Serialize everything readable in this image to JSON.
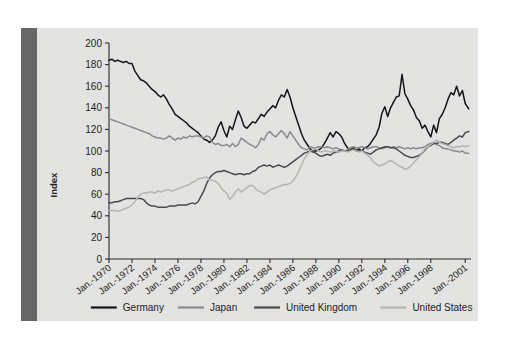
{
  "figure": {
    "background_color": "#e3e3e1",
    "spine_color": "#676767",
    "page_background": "#ffffff"
  },
  "chart_data": {
    "type": "line",
    "title": "",
    "subtitle": "",
    "xlabel": "",
    "ylabel": "Index",
    "ylim": [
      0,
      200
    ],
    "ytick_step": 20,
    "yticks": [
      0,
      20,
      40,
      60,
      80,
      100,
      120,
      140,
      160,
      180,
      200
    ],
    "ytick_labels": [
      "0",
      "20",
      "40",
      "60",
      "80",
      "100",
      "120",
      "140",
      "160",
      "180",
      "200"
    ],
    "xtick_labels": [
      "Jan.-1970",
      "Jan.-1972",
      "Jan.-1974",
      "Jan.-1976",
      "Jan.-1978",
      "Jan.-1980",
      "Jan.-1982",
      "Jan.-1984",
      "Jan.-1986",
      "Jan.-1988",
      "Jan.-1990",
      "Jan.-1992",
      "Jan.-1994",
      "Jan.-1996",
      "Jan.-1998",
      "Jan.-2001"
    ],
    "xtick_years": [
      1970,
      1972,
      1974,
      1976,
      1978,
      1980,
      1982,
      1984,
      1986,
      1988,
      1990,
      1992,
      1994,
      1996,
      1998,
      2001
    ],
    "xlim": [
      1970,
      2001.5
    ],
    "grid": false,
    "legend_position": "bottom",
    "legend_entries": [
      "Germany",
      "Japan",
      "United Kingdom",
      "United States"
    ],
    "series": [
      {
        "name": "Germany",
        "color": "#141414",
        "x": [
          1970.0,
          1970.25,
          1970.5,
          1970.75,
          1971.0,
          1971.25,
          1971.5,
          1971.75,
          1972.0,
          1972.25,
          1972.5,
          1972.75,
          1973.0,
          1973.25,
          1973.5,
          1973.75,
          1974.0,
          1974.25,
          1974.5,
          1974.75,
          1975.0,
          1975.25,
          1975.5,
          1975.75,
          1976.0,
          1976.25,
          1976.5,
          1976.75,
          1977.0,
          1977.25,
          1977.5,
          1977.75,
          1978.0,
          1978.25,
          1978.5,
          1978.75,
          1979.0,
          1979.25,
          1979.5,
          1979.75,
          1980.0,
          1980.25,
          1980.5,
          1980.75,
          1981.0,
          1981.25,
          1981.5,
          1981.75,
          1982.0,
          1982.25,
          1982.5,
          1982.75,
          1983.0,
          1983.25,
          1983.5,
          1983.75,
          1984.0,
          1984.25,
          1984.5,
          1984.75,
          1985.0,
          1985.25,
          1985.5,
          1985.75,
          1986.0,
          1986.25,
          1986.5,
          1986.75,
          1987.0,
          1987.25,
          1987.5,
          1987.75,
          1988.0,
          1988.25,
          1988.5,
          1988.75,
          1989.0,
          1989.25,
          1989.5,
          1989.75,
          1990.0,
          1990.25,
          1990.5,
          1990.75,
          1991.0,
          1991.25,
          1991.5,
          1991.75,
          1992.0,
          1992.25,
          1992.5,
          1992.75,
          1993.0,
          1993.25,
          1993.5,
          1993.75,
          1994.0,
          1994.25,
          1994.5,
          1994.75,
          1995.0,
          1995.25,
          1995.5,
          1995.75,
          1996.0,
          1996.25,
          1996.5,
          1996.75,
          1997.0,
          1997.25,
          1997.5,
          1997.75,
          1998.0,
          1998.25,
          1998.5,
          1998.75,
          1999.0,
          1999.25,
          1999.5,
          1999.75,
          2000.0,
          2000.25,
          2000.5,
          2000.75,
          2001.0,
          2001.3
        ],
        "y": [
          184,
          185,
          183,
          184,
          183,
          182,
          183,
          181,
          181,
          174,
          170,
          166,
          165,
          163,
          160,
          157,
          155,
          152,
          150,
          152,
          148,
          143,
          139,
          134,
          132,
          130,
          128,
          126,
          123,
          121,
          119,
          117,
          114,
          111,
          110,
          108,
          110,
          114,
          122,
          127,
          119,
          113,
          123,
          120,
          129,
          137,
          131,
          123,
          121,
          124,
          127,
          126,
          130,
          134,
          132,
          136,
          139,
          142,
          140,
          147,
          152,
          150,
          157,
          150,
          140,
          132,
          124,
          116,
          110,
          106,
          102,
          100,
          100,
          101,
          103,
          107,
          112,
          117,
          113,
          118,
          116,
          113,
          107,
          103,
          101,
          103,
          100,
          102,
          100,
          103,
          104,
          107,
          111,
          115,
          122,
          135,
          141,
          132,
          140,
          145,
          150,
          151,
          171,
          153,
          148,
          142,
          138,
          131,
          128,
          121,
          124,
          118,
          113,
          124,
          117,
          130,
          134,
          140,
          148,
          154,
          152,
          160,
          151,
          156,
          144,
          139
        ]
      },
      {
        "name": "Japan",
        "color": "#8a8a8a",
        "x": [
          1970.0,
          1970.25,
          1970.5,
          1970.75,
          1971.0,
          1971.25,
          1971.5,
          1971.75,
          1972.0,
          1972.25,
          1972.5,
          1972.75,
          1973.0,
          1973.25,
          1973.5,
          1973.75,
          1974.0,
          1974.25,
          1974.5,
          1974.75,
          1975.0,
          1975.25,
          1975.5,
          1975.75,
          1976.0,
          1976.25,
          1976.5,
          1976.75,
          1977.0,
          1977.25,
          1977.5,
          1977.75,
          1978.0,
          1978.25,
          1978.5,
          1978.75,
          1979.0,
          1979.25,
          1979.5,
          1979.75,
          1980.0,
          1980.25,
          1980.5,
          1980.75,
          1981.0,
          1981.25,
          1981.5,
          1981.75,
          1982.0,
          1982.25,
          1982.5,
          1982.75,
          1983.0,
          1983.25,
          1983.5,
          1983.75,
          1984.0,
          1984.25,
          1984.5,
          1984.75,
          1985.0,
          1985.25,
          1985.5,
          1985.75,
          1986.0,
          1986.25,
          1986.5,
          1986.75,
          1987.0,
          1987.25,
          1987.5,
          1987.75,
          1988.0,
          1988.25,
          1988.5,
          1988.75,
          1989.0,
          1989.25,
          1989.5,
          1989.75,
          1990.0,
          1990.25,
          1990.5,
          1990.75,
          1991.0,
          1991.25,
          1991.5,
          1991.75,
          1992.0,
          1992.25,
          1992.5,
          1992.75,
          1993.0,
          1993.25,
          1993.5,
          1993.75,
          1994.0,
          1994.25,
          1994.5,
          1994.75,
          1995.0,
          1995.25,
          1995.5,
          1995.75,
          1996.0,
          1996.25,
          1996.5,
          1996.75,
          1997.0,
          1997.25,
          1997.5,
          1997.75,
          1998.0,
          1998.25,
          1998.5,
          1998.75,
          1999.0,
          1999.25,
          1999.5,
          1999.75,
          2000.0,
          2000.25,
          2000.5,
          2000.75,
          2001.0,
          2001.3
        ],
        "y": [
          130,
          129,
          128,
          127,
          126,
          125,
          124,
          123,
          122,
          121,
          120,
          119,
          118,
          117,
          116,
          114,
          113,
          112,
          112,
          111,
          112,
          114,
          112,
          110,
          112,
          111,
          113,
          112,
          114,
          113,
          114,
          114,
          113,
          112,
          114,
          113,
          108,
          106,
          107,
          105,
          105,
          106,
          104,
          107,
          104,
          106,
          112,
          110,
          108,
          106,
          105,
          103,
          106,
          112,
          110,
          116,
          118,
          115,
          113,
          116,
          119,
          116,
          112,
          118,
          114,
          110,
          106,
          103,
          102,
          101,
          104,
          103,
          103,
          104,
          104,
          103,
          104,
          103,
          102,
          103,
          102,
          101,
          100,
          101,
          103,
          104,
          103,
          103,
          104,
          103,
          102,
          103,
          104,
          104,
          103,
          102,
          103,
          104,
          103,
          104,
          103,
          104,
          103,
          102,
          103,
          102,
          103,
          102,
          103,
          103,
          104,
          106,
          107,
          108,
          106,
          105,
          103,
          102,
          102,
          101,
          100,
          100,
          99,
          100,
          98,
          98
        ]
      },
      {
        "name": "United Kingdom",
        "color": "#4a4a4a",
        "x": [
          1970.0,
          1970.25,
          1970.5,
          1970.75,
          1971.0,
          1971.25,
          1971.5,
          1971.75,
          1972.0,
          1972.25,
          1972.5,
          1972.75,
          1973.0,
          1973.25,
          1973.5,
          1973.75,
          1974.0,
          1974.25,
          1974.5,
          1974.75,
          1975.0,
          1975.25,
          1975.5,
          1975.75,
          1976.0,
          1976.25,
          1976.5,
          1976.75,
          1977.0,
          1977.25,
          1977.5,
          1977.75,
          1978.0,
          1978.25,
          1978.5,
          1978.75,
          1979.0,
          1979.25,
          1979.5,
          1979.75,
          1980.0,
          1980.25,
          1980.5,
          1980.75,
          1981.0,
          1981.25,
          1981.5,
          1981.75,
          1982.0,
          1982.25,
          1982.5,
          1982.75,
          1983.0,
          1983.25,
          1983.5,
          1983.75,
          1984.0,
          1984.25,
          1984.5,
          1984.75,
          1985.0,
          1985.25,
          1985.5,
          1985.75,
          1986.0,
          1986.25,
          1986.5,
          1986.75,
          1987.0,
          1987.25,
          1987.5,
          1987.75,
          1988.0,
          1988.25,
          1988.5,
          1988.75,
          1989.0,
          1989.25,
          1989.5,
          1989.75,
          1990.0,
          1990.25,
          1990.5,
          1990.75,
          1991.0,
          1991.25,
          1991.5,
          1991.75,
          1992.0,
          1992.25,
          1992.5,
          1992.75,
          1993.0,
          1993.25,
          1993.5,
          1993.75,
          1994.0,
          1994.25,
          1994.5,
          1994.75,
          1995.0,
          1995.25,
          1995.5,
          1995.75,
          1996.0,
          1996.25,
          1996.5,
          1996.75,
          1997.0,
          1997.25,
          1997.5,
          1997.75,
          1998.0,
          1998.25,
          1998.5,
          1998.75,
          1999.0,
          1999.25,
          1999.5,
          1999.75,
          2000.0,
          2000.25,
          2000.5,
          2000.75,
          2001.0,
          2001.3
        ],
        "y": [
          52,
          52,
          53,
          53,
          54,
          55,
          56,
          56,
          56,
          56,
          56,
          56,
          55,
          52,
          50,
          49,
          49,
          48,
          48,
          48,
          48,
          49,
          49,
          49,
          50,
          50,
          50,
          50,
          51,
          52,
          51,
          53,
          58,
          63,
          70,
          75,
          78,
          80,
          81,
          81,
          82,
          81,
          80,
          79,
          78,
          79,
          79,
          78,
          79,
          79,
          81,
          82,
          85,
          86,
          87,
          86,
          87,
          85,
          86,
          87,
          86,
          85,
          86,
          88,
          90,
          92,
          94,
          96,
          98,
          99,
          100,
          99,
          98,
          96,
          95,
          96,
          97,
          96,
          98,
          99,
          100,
          101,
          100,
          100,
          101,
          102,
          101,
          100,
          100,
          99,
          98,
          97,
          99,
          101,
          102,
          103,
          104,
          104,
          103,
          103,
          102,
          100,
          98,
          96,
          95,
          94,
          94,
          95,
          96,
          98,
          101,
          104,
          105,
          107,
          107,
          108,
          108,
          107,
          106,
          108,
          110,
          112,
          114,
          113,
          117,
          118
        ]
      },
      {
        "name": "United States",
        "color": "#b4b4b2",
        "x": [
          1970.0,
          1970.25,
          1970.5,
          1970.75,
          1971.0,
          1971.25,
          1971.5,
          1971.75,
          1972.0,
          1972.25,
          1972.5,
          1972.75,
          1973.0,
          1973.25,
          1973.5,
          1973.75,
          1974.0,
          1974.25,
          1974.5,
          1974.75,
          1975.0,
          1975.25,
          1975.5,
          1975.75,
          1976.0,
          1976.25,
          1976.5,
          1976.75,
          1977.0,
          1977.25,
          1977.5,
          1977.75,
          1978.0,
          1978.25,
          1978.5,
          1978.75,
          1979.0,
          1979.25,
          1979.5,
          1979.75,
          1980.0,
          1980.25,
          1980.5,
          1980.75,
          1981.0,
          1981.25,
          1981.5,
          1981.75,
          1982.0,
          1982.25,
          1982.5,
          1982.75,
          1983.0,
          1983.25,
          1983.5,
          1983.75,
          1984.0,
          1984.25,
          1984.5,
          1984.75,
          1985.0,
          1985.25,
          1985.5,
          1985.75,
          1986.0,
          1986.25,
          1986.5,
          1986.75,
          1987.0,
          1987.25,
          1987.5,
          1987.75,
          1988.0,
          1988.25,
          1988.5,
          1988.75,
          1989.0,
          1989.25,
          1989.5,
          1989.75,
          1990.0,
          1990.25,
          1990.5,
          1990.75,
          1991.0,
          1991.25,
          1991.5,
          1991.75,
          1992.0,
          1992.25,
          1992.5,
          1992.75,
          1993.0,
          1993.25,
          1993.5,
          1993.75,
          1994.0,
          1994.25,
          1994.5,
          1994.75,
          1995.0,
          1995.25,
          1995.5,
          1995.75,
          1996.0,
          1996.25,
          1996.5,
          1996.75,
          1997.0,
          1997.25,
          1997.5,
          1997.75,
          1998.0,
          1998.25,
          1998.5,
          1998.75,
          1999.0,
          1999.25,
          1999.5,
          1999.75,
          2000.0,
          2000.25,
          2000.5,
          2000.75,
          2001.0,
          2001.3
        ],
        "y": [
          45,
          45,
          45,
          44,
          45,
          46,
          47,
          48,
          50,
          53,
          57,
          60,
          61,
          61,
          62,
          62,
          61,
          63,
          62,
          63,
          64,
          64,
          63,
          64,
          65,
          66,
          67,
          68,
          69,
          71,
          72,
          74,
          75,
          75,
          76,
          73,
          73,
          72,
          70,
          66,
          63,
          61,
          55,
          58,
          62,
          65,
          62,
          64,
          66,
          68,
          68,
          65,
          63,
          62,
          60,
          62,
          64,
          65,
          66,
          67,
          68,
          69,
          69,
          70,
          72,
          76,
          81,
          87,
          93,
          97,
          100,
          101,
          102,
          100,
          99,
          100,
          100,
          99,
          100,
          100,
          99,
          100,
          100,
          99,
          100,
          101,
          100,
          99,
          100,
          98,
          96,
          94,
          90,
          88,
          86,
          87,
          88,
          90,
          91,
          90,
          88,
          86,
          85,
          83,
          84,
          86,
          89,
          92,
          95,
          98,
          102,
          104,
          106,
          108,
          110,
          108,
          107,
          106,
          105,
          104,
          103,
          104,
          104,
          105,
          104,
          105
        ]
      }
    ]
  }
}
